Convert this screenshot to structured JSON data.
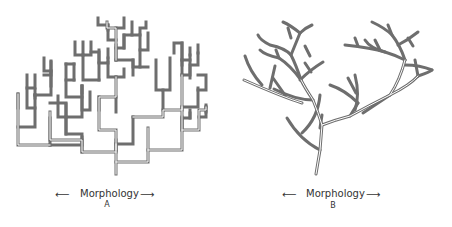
{
  "figure": {
    "panel_a": {
      "axis_label": "Morphology",
      "panel_letter": "A",
      "style": "orthogonal-branching-tree",
      "stroke_color": "#6e6e6e"
    },
    "panel_b": {
      "axis_label": "Morphology",
      "panel_letter": "B",
      "style": "curved-branching-tree",
      "stroke_color": "#6e6e6e"
    },
    "left_arrow": "⟵",
    "right_arrow": "⟶"
  }
}
